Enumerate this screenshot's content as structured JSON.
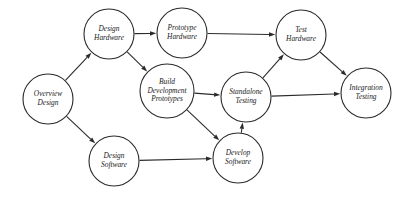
{
  "diagram": {
    "type": "directed-graph",
    "canvas": {
      "width": 408,
      "height": 207,
      "background": "#ffffff"
    },
    "style": {
      "node_fill": "#ffffff",
      "node_stroke": "#2b2b2b",
      "edge_stroke": "#2b2b2b",
      "label_color": "#1a1a1a"
    },
    "nodes": [
      {
        "id": "overview-design",
        "lines": [
          "Overview",
          "Design"
        ],
        "line1": "Overview",
        "line2": "Design",
        "cx": 48,
        "cy": 99,
        "r": 25
      },
      {
        "id": "design-hardware",
        "lines": [
          "Design",
          "Hardware"
        ],
        "line1": "Design",
        "line2": "Hardware",
        "cx": 109,
        "cy": 34,
        "r": 25
      },
      {
        "id": "prototype-hardware",
        "lines": [
          "Prototype",
          "Hardware"
        ],
        "line1": "Prototype",
        "line2": "Hardware",
        "cx": 182,
        "cy": 33,
        "r": 25
      },
      {
        "id": "build-development-prototypes",
        "lines": [
          "Build",
          "Development",
          "Prototypes"
        ],
        "line1": "Build",
        "line2": "Development",
        "line3": "Prototypes",
        "cx": 167,
        "cy": 91,
        "r": 27
      },
      {
        "id": "test-hardware",
        "lines": [
          "Test",
          "Hardware"
        ],
        "line1": "Test",
        "line2": "Hardware",
        "cx": 301,
        "cy": 35,
        "r": 25
      },
      {
        "id": "standalone-testing",
        "lines": [
          "Standalone",
          "Testing"
        ],
        "line1": "Standalone",
        "line2": "Testing",
        "cx": 246,
        "cy": 97,
        "r": 25
      },
      {
        "id": "integration-testing",
        "lines": [
          "Integration",
          "Testing"
        ],
        "line1": "Integration",
        "line2": "Testing",
        "cx": 366,
        "cy": 93,
        "r": 25
      },
      {
        "id": "design-software",
        "lines": [
          "Design",
          "Software"
        ],
        "line1": "Design",
        "line2": "Software",
        "cx": 114,
        "cy": 161,
        "r": 25
      },
      {
        "id": "develop-software",
        "lines": [
          "Develop",
          "Software"
        ],
        "line1": "Develop",
        "line2": "Software",
        "cx": 238,
        "cy": 158,
        "r": 25
      }
    ],
    "edges": [
      {
        "id": "overview-design-to-design-hardware",
        "from": "overview-design",
        "to": "design-hardware"
      },
      {
        "id": "overview-design-to-design-software",
        "from": "overview-design",
        "to": "design-software"
      },
      {
        "id": "design-hardware-to-prototype-hardware",
        "from": "design-hardware",
        "to": "prototype-hardware"
      },
      {
        "id": "design-hardware-to-build-development-prototypes",
        "from": "design-hardware",
        "to": "build-development-prototypes"
      },
      {
        "id": "prototype-hardware-to-test-hardware",
        "from": "prototype-hardware",
        "to": "test-hardware"
      },
      {
        "id": "build-development-prototypes-to-standalone-testing",
        "from": "build-development-prototypes",
        "to": "standalone-testing"
      },
      {
        "id": "build-development-prototypes-to-develop-software",
        "from": "build-development-prototypes",
        "to": "develop-software"
      },
      {
        "id": "design-software-to-develop-software",
        "from": "design-software",
        "to": "develop-software"
      },
      {
        "id": "develop-software-to-standalone-testing",
        "from": "develop-software",
        "to": "standalone-testing"
      },
      {
        "id": "standalone-testing-to-test-hardware",
        "from": "standalone-testing",
        "to": "test-hardware"
      },
      {
        "id": "standalone-testing-to-integration-testing",
        "from": "standalone-testing",
        "to": "integration-testing"
      },
      {
        "id": "test-hardware-to-integration-testing",
        "from": "test-hardware",
        "to": "integration-testing"
      }
    ]
  }
}
